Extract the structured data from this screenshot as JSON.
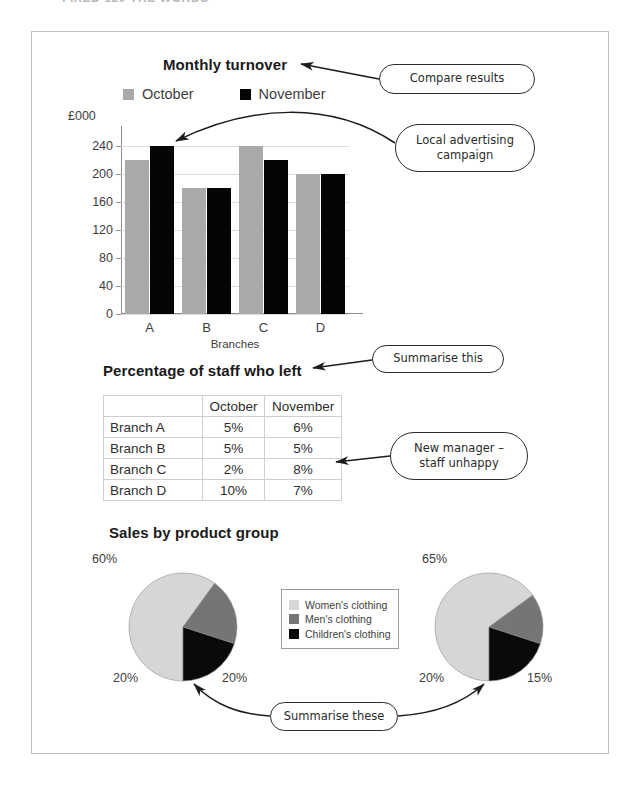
{
  "page": {
    "top_fragment": "FIXED 120     THE WORDS"
  },
  "bar_chart": {
    "title": "Monthly turnover",
    "y_axis_title": "£000",
    "x_axis_title": "Branches",
    "legend": [
      {
        "label": "October",
        "color": "#a9a9a9"
      },
      {
        "label": "November",
        "color": "#050505"
      }
    ]
  },
  "staff_table": {
    "title": "Percentage of staff who left",
    "corner": "",
    "columns": [
      "October",
      "November"
    ],
    "rows": [
      {
        "branch": "Branch A",
        "october": "5%",
        "november": "6%"
      },
      {
        "branch": "Branch B",
        "october": "5%",
        "november": "5%"
      },
      {
        "branch": "Branch C",
        "october": "2%",
        "november": "8%"
      },
      {
        "branch": "Branch D",
        "october": "10%",
        "november": "7%"
      }
    ]
  },
  "pies": {
    "title": "Sales by product group",
    "legend": [
      {
        "label": "Women's clothing",
        "color": "#d6d6d6"
      },
      {
        "label": "Men's clothing",
        "color": "#757575"
      },
      {
        "label": "Children's clothing",
        "color": "#0a0a0a"
      }
    ],
    "left": {
      "labels": {
        "women": "60%",
        "men": "20%",
        "children": "20%"
      }
    },
    "right": {
      "labels": {
        "women": "65%",
        "men": "15%",
        "children": "20%"
      }
    }
  },
  "callouts": {
    "compare_results": "Compare results",
    "local_advertising_line1": "Local advertising",
    "local_advertising_line2": "campaign",
    "summarise_this": "Summarise this",
    "new_manager_line1": "New manager –",
    "new_manager_line2": "staff unhappy",
    "summarise_these": "Summarise these"
  },
  "chart_data": [
    {
      "type": "bar",
      "title": "Monthly turnover",
      "xlabel": "Branches",
      "ylabel": "£000",
      "categories": [
        "A",
        "B",
        "C",
        "D"
      ],
      "series": [
        {
          "name": "October",
          "values": [
            220,
            180,
            240,
            200
          ],
          "color": "#a9a9a9"
        },
        {
          "name": "November",
          "values": [
            240,
            180,
            220,
            200
          ],
          "color": "#050505"
        }
      ],
      "ylim": [
        0,
        260
      ],
      "yticks": [
        0,
        40,
        80,
        120,
        160,
        200,
        240
      ],
      "grid": true,
      "legend_position": "top"
    },
    {
      "type": "table",
      "title": "Percentage of staff who left",
      "columns": [
        "",
        "October",
        "November"
      ],
      "rows": [
        [
          "Branch A",
          "5%",
          "6%"
        ],
        [
          "Branch B",
          "5%",
          "5%"
        ],
        [
          "Branch C",
          "2%",
          "8%"
        ],
        [
          "Branch D",
          "10%",
          "7%"
        ]
      ]
    },
    {
      "type": "pie",
      "title": "Sales by product group",
      "subtitle": "left pie",
      "categories": [
        "Women's clothing",
        "Men's clothing",
        "Children's clothing"
      ],
      "values": [
        60,
        20,
        20
      ],
      "colors": [
        "#d6d6d6",
        "#757575",
        "#0a0a0a"
      ],
      "legend_position": "right"
    },
    {
      "type": "pie",
      "title": "Sales by product group",
      "subtitle": "right pie",
      "categories": [
        "Women's clothing",
        "Men's clothing",
        "Children's clothing"
      ],
      "values": [
        65,
        15,
        20
      ],
      "colors": [
        "#d6d6d6",
        "#757575",
        "#0a0a0a"
      ],
      "legend_position": "left"
    }
  ]
}
